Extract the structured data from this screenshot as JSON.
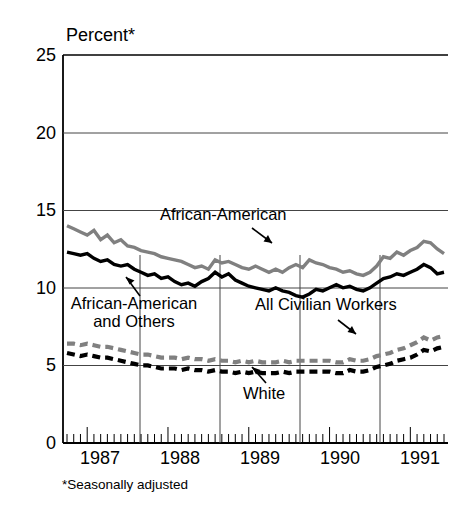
{
  "figure": {
    "axis_title": "Percent*",
    "footnote": "*Seasonally adjusted",
    "colors": {
      "dark_series": "#000000",
      "light_series": "#808080",
      "axis": "#000000",
      "gridline": "#555555",
      "background": "#ffffff"
    }
  },
  "annotations": {
    "african_american": "African-American",
    "african_american_and_others_line1": "African-American",
    "african_american_and_others_line2": "and Others",
    "all_civilian_workers": "All Civilian Workers",
    "white": "White"
  },
  "axes": {
    "y_ticks": [
      "0",
      "5",
      "10",
      "15",
      "20",
      "25"
    ],
    "x_ticks": [
      "1987",
      "1988",
      "1989",
      "1990",
      "1991"
    ]
  },
  "chart_data": {
    "type": "line",
    "title": "Percent*",
    "subtitle": "",
    "xlabel": "",
    "ylabel": "Percent",
    "ylim": [
      0,
      25
    ],
    "ytick_values": [
      0,
      5,
      10,
      15,
      20,
      25
    ],
    "xlim": [
      "1986-10",
      "1991-07"
    ],
    "xtick_labels": [
      "1987",
      "1988",
      "1989",
      "1990",
      "1991"
    ],
    "grid": "horizontal gridlines at 5,10,15,20,25; vertical year separators at mid-1987, mid-1988, mid-1989, mid-1990",
    "legend_position": "inline annotations with leader arrows",
    "note": "Monthly unemployment rates, seasonally adjusted, Oct 1986 - Jun 1991",
    "x": [
      "1986-10",
      "1986-11",
      "1986-12",
      "1987-01",
      "1987-02",
      "1987-03",
      "1987-04",
      "1987-05",
      "1987-06",
      "1987-07",
      "1987-08",
      "1987-09",
      "1987-10",
      "1987-11",
      "1987-12",
      "1988-01",
      "1988-02",
      "1988-03",
      "1988-04",
      "1988-05",
      "1988-06",
      "1988-07",
      "1988-08",
      "1988-09",
      "1988-10",
      "1988-11",
      "1988-12",
      "1989-01",
      "1989-02",
      "1989-03",
      "1989-04",
      "1989-05",
      "1989-06",
      "1989-07",
      "1989-08",
      "1989-09",
      "1989-10",
      "1989-11",
      "1989-12",
      "1990-01",
      "1990-02",
      "1990-03",
      "1990-04",
      "1990-05",
      "1990-06",
      "1990-07",
      "1990-08",
      "1990-09",
      "1990-10",
      "1990-11",
      "1990-12",
      "1991-01",
      "1991-02",
      "1991-03",
      "1991-04",
      "1991-05",
      "1991-06"
    ],
    "series": [
      {
        "name": "African-American",
        "style": "solid",
        "color": "#808080",
        "values": [
          14.0,
          13.8,
          13.6,
          13.4,
          13.7,
          13.1,
          13.4,
          12.9,
          13.1,
          12.7,
          12.6,
          12.4,
          12.3,
          12.2,
          12.0,
          11.9,
          11.8,
          11.7,
          11.5,
          11.3,
          11.4,
          11.2,
          11.8,
          11.6,
          11.7,
          11.5,
          11.3,
          11.2,
          11.4,
          11.2,
          11.0,
          11.2,
          11.0,
          11.3,
          11.5,
          11.3,
          11.8,
          11.6,
          11.5,
          11.3,
          11.2,
          11.0,
          11.1,
          10.9,
          10.8,
          11.0,
          11.4,
          12.0,
          11.9,
          12.3,
          12.1,
          12.4,
          12.6,
          13.0,
          12.9,
          12.5,
          12.2
        ]
      },
      {
        "name": "African-American and Others",
        "style": "solid",
        "color": "#000000",
        "values": [
          12.3,
          12.2,
          12.1,
          12.2,
          11.9,
          11.7,
          11.8,
          11.5,
          11.4,
          11.5,
          11.2,
          11.0,
          10.8,
          10.9,
          10.6,
          10.7,
          10.4,
          10.2,
          10.3,
          10.1,
          10.4,
          10.6,
          11.0,
          10.7,
          10.9,
          10.5,
          10.3,
          10.1,
          10.0,
          9.9,
          9.8,
          10.0,
          9.8,
          9.7,
          9.5,
          9.4,
          9.6,
          9.9,
          9.8,
          10.0,
          10.2,
          10.0,
          10.1,
          9.9,
          9.8,
          10.0,
          10.3,
          10.6,
          10.7,
          10.9,
          10.8,
          11.0,
          11.2,
          11.5,
          11.3,
          10.9,
          11.0
        ]
      },
      {
        "name": "All Civilian Workers",
        "style": "dashed",
        "color": "#808080",
        "values": [
          6.4,
          6.4,
          6.3,
          6.4,
          6.3,
          6.2,
          6.2,
          6.1,
          6.0,
          5.9,
          5.8,
          5.7,
          5.7,
          5.6,
          5.5,
          5.5,
          5.5,
          5.4,
          5.5,
          5.4,
          5.4,
          5.3,
          5.4,
          5.3,
          5.3,
          5.2,
          5.3,
          5.2,
          5.3,
          5.2,
          5.2,
          5.2,
          5.3,
          5.2,
          5.3,
          5.3,
          5.3,
          5.3,
          5.3,
          5.3,
          5.2,
          5.2,
          5.4,
          5.3,
          5.3,
          5.4,
          5.6,
          5.7,
          5.8,
          6.0,
          6.1,
          6.3,
          6.5,
          6.8,
          6.6,
          6.8,
          6.9
        ]
      },
      {
        "name": "White",
        "style": "dashed",
        "color": "#000000",
        "values": [
          5.8,
          5.7,
          5.6,
          5.7,
          5.6,
          5.5,
          5.5,
          5.4,
          5.3,
          5.2,
          5.1,
          5.0,
          5.0,
          4.9,
          4.8,
          4.8,
          4.8,
          4.7,
          4.8,
          4.7,
          4.7,
          4.6,
          4.7,
          4.6,
          4.6,
          4.5,
          4.6,
          4.5,
          4.6,
          4.5,
          4.5,
          4.5,
          4.6,
          4.5,
          4.6,
          4.6,
          4.6,
          4.6,
          4.6,
          4.6,
          4.5,
          4.5,
          4.7,
          4.6,
          4.6,
          4.7,
          4.9,
          5.0,
          5.1,
          5.3,
          5.4,
          5.5,
          5.7,
          6.0,
          5.9,
          6.1,
          6.2
        ]
      }
    ]
  }
}
